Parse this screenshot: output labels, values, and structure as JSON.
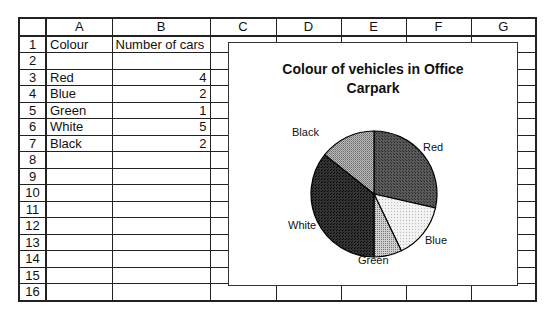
{
  "sheet": {
    "columns": [
      "A",
      "B",
      "C",
      "D",
      "E",
      "F",
      "G"
    ],
    "rows": [
      {
        "n": "1",
        "a": "Colour",
        "b": "Number of cars"
      },
      {
        "n": "2",
        "a": "",
        "b": ""
      },
      {
        "n": "3",
        "a": "Red",
        "b": "4"
      },
      {
        "n": "4",
        "a": "Blue",
        "b": "2"
      },
      {
        "n": "5",
        "a": "Green",
        "b": "1"
      },
      {
        "n": "6",
        "a": "White",
        "b": "5"
      },
      {
        "n": "7",
        "a": "Black",
        "b": "2"
      },
      {
        "n": "8",
        "a": "",
        "b": ""
      },
      {
        "n": "9",
        "a": "",
        "b": ""
      },
      {
        "n": "10",
        "a": "",
        "b": ""
      },
      {
        "n": "11",
        "a": "",
        "b": ""
      },
      {
        "n": "12",
        "a": "",
        "b": ""
      },
      {
        "n": "13",
        "a": "",
        "b": ""
      },
      {
        "n": "14",
        "a": "",
        "b": ""
      },
      {
        "n": "15",
        "a": "",
        "b": ""
      },
      {
        "n": "16",
        "a": "",
        "b": ""
      }
    ]
  },
  "chart": {
    "title_line1": "Colour of vehicles in Office",
    "title_line2": "Carpark"
  },
  "chart_data": {
    "type": "pie",
    "title": "Colour of vehicles in Office Carpark",
    "categories": [
      "Red",
      "Blue",
      "Green",
      "White",
      "Black"
    ],
    "values": [
      4,
      2,
      1,
      5,
      2
    ],
    "legend": "none (data labels shown next to slices)",
    "fills": {
      "Red": "#4a4a4a",
      "Blue": "#eeeeee",
      "Green": "#b8b8b8",
      "White": "#2a2a2a",
      "Black": "#9a9a9a"
    }
  }
}
